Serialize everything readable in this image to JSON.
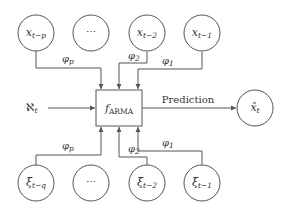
{
  "diagram": {
    "center_node": {
      "label": "f",
      "subscript": "ARMA"
    },
    "input_label": {
      "symbol": "ℵ",
      "subscript": "t"
    },
    "output_edge_label": "Prediction",
    "output_node": {
      "label": "x̂",
      "subscript": "t"
    },
    "top_nodes": [
      {
        "label": "x",
        "subscript": "t−p"
      },
      {
        "label": "⋯",
        "subscript": ""
      },
      {
        "label": "x",
        "subscript": "t−2"
      },
      {
        "label": "x",
        "subscript": "t−1"
      }
    ],
    "bottom_nodes": [
      {
        "label": "ξ",
        "subscript": "t−q"
      },
      {
        "label": "⋯",
        "subscript": ""
      },
      {
        "label": "ξ",
        "subscript": "t−2"
      },
      {
        "label": "ξ",
        "subscript": "t−1"
      }
    ],
    "top_edge_labels": [
      {
        "label": "φ",
        "subscript": "p"
      },
      {
        "label": "φ",
        "subscript": "2"
      },
      {
        "label": "φ",
        "subscript": "1"
      }
    ],
    "bottom_edge_labels": [
      {
        "label": "φ",
        "subscript": "p"
      },
      {
        "label": "φ",
        "subscript": "2"
      },
      {
        "label": "φ",
        "subscript": "1"
      }
    ]
  }
}
